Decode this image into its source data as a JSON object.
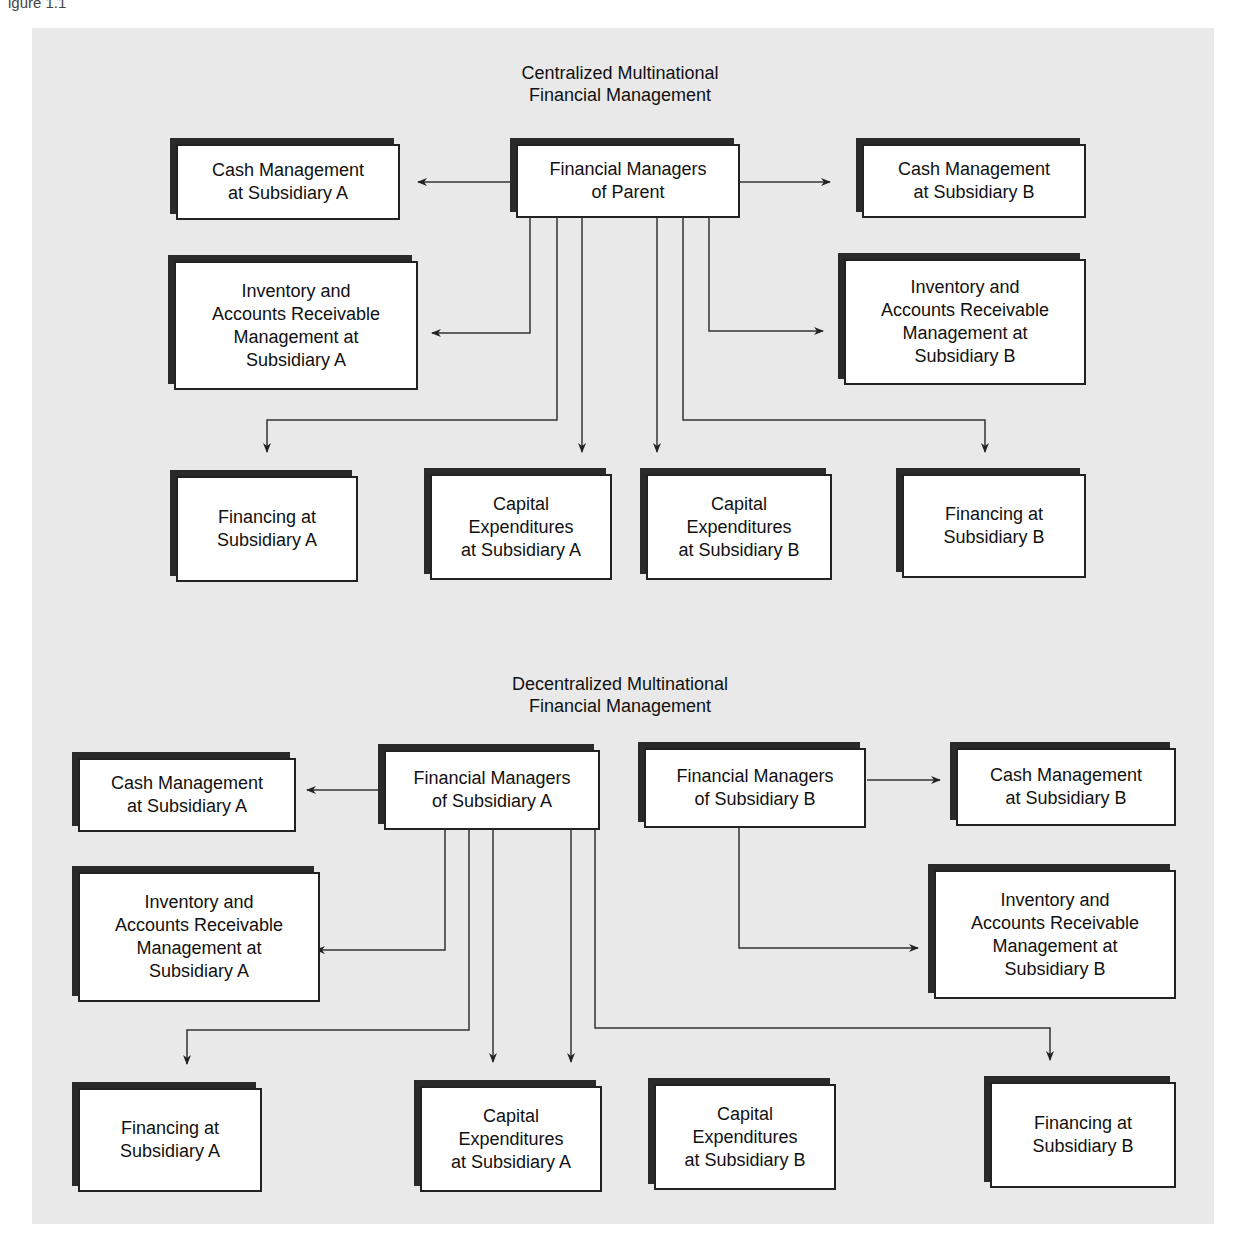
{
  "caption": "igure 1.1",
  "centralized": {
    "title": "Centralized Multinational\nFinancial Management",
    "boxes": {
      "parent": "Financial Managers\nof Parent",
      "cash_a": "Cash Management\nat Subsidiary A",
      "cash_b": "Cash Management\nat Subsidiary B",
      "inv_a": "Inventory and\nAccounts Receivable\nManagement at\nSubsidiary A",
      "inv_b": "Inventory and\nAccounts Receivable\nManagement at\nSubsidiary B",
      "fin_a": "Financing at\nSubsidiary A",
      "cap_a": "Capital\nExpenditures\nat Subsidiary A",
      "cap_b": "Capital\nExpenditures\nat Subsidiary B",
      "fin_b": "Financing at\nSubsidiary B"
    }
  },
  "decentralized": {
    "title": "Decentralized Multinational\nFinancial Management",
    "boxes": {
      "mgr_a": "Financial Managers\nof Subsidiary A",
      "mgr_b": "Financial Managers\nof Subsidiary B",
      "cash_a": "Cash Management\nat Subsidiary A",
      "cash_b": "Cash Management\nat Subsidiary B",
      "inv_a": "Inventory and\nAccounts Receivable\nManagement at\nSubsidiary A",
      "inv_b": "Inventory and\nAccounts Receivable\nManagement at\nSubsidiary B",
      "fin_a": "Financing at\nSubsidiary A",
      "cap_a": "Capital\nExpenditures\nat Subsidiary A",
      "cap_b": "Capital\nExpenditures\nat Subsidiary B",
      "fin_b": "Financing at\nSubsidiary B"
    }
  }
}
